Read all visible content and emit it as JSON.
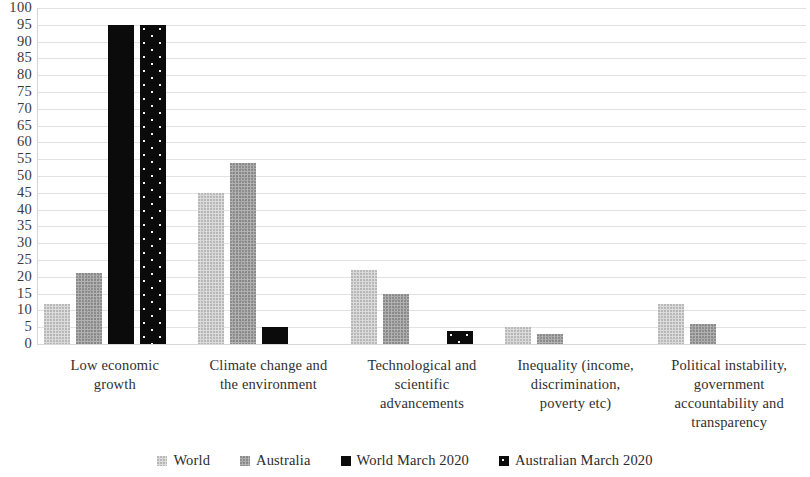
{
  "chart_data": {
    "type": "bar",
    "title": "",
    "subtitle": "",
    "xlabel": "",
    "ylabel": "",
    "ylim": [
      0,
      100
    ],
    "y_ticks": [
      0,
      5,
      10,
      15,
      20,
      25,
      30,
      35,
      40,
      45,
      50,
      55,
      60,
      65,
      70,
      75,
      80,
      85,
      90,
      95,
      100
    ],
    "grid": true,
    "legend_position": "bottom",
    "categories": [
      "Low economic growth",
      "Climate change and the environment",
      "Technological and scientific advancements",
      "Inequality (income, discrimination, poverty etc)",
      "Political instability, government accountability and transparency"
    ],
    "category_label_lines": [
      [
        "Low economic",
        "growth"
      ],
      [
        "Climate change and",
        "the environment"
      ],
      [
        "Technological and",
        "scientific",
        "advancements"
      ],
      [
        "Inequality (income,",
        "discrimination,",
        "poverty etc)"
      ],
      [
        "Political instability,",
        "government",
        "accountability and",
        "transparency"
      ]
    ],
    "series": [
      {
        "name": "World",
        "fill": "light-gray-speckle",
        "color": "#dcdcdc",
        "values": [
          12,
          45,
          22,
          5,
          12
        ]
      },
      {
        "name": "Australia",
        "fill": "medium-gray-speckle",
        "color": "#b2b2b2",
        "values": [
          21,
          54,
          15,
          3,
          6
        ]
      },
      {
        "name": "World March 2020",
        "fill": "solid-black",
        "color": "#0b0b0b",
        "values": [
          95,
          5,
          null,
          null,
          null
        ]
      },
      {
        "name": "Australian March 2020",
        "fill": "black-with-white-dots",
        "color": "#0b0b0b",
        "values": [
          95,
          null,
          4,
          null,
          null
        ]
      }
    ]
  },
  "legend": {
    "items": [
      {
        "label": "World",
        "swatch": "light-gray-speckle"
      },
      {
        "label": "Australia",
        "swatch": "medium-gray-speckle"
      },
      {
        "label": "World March 2020",
        "swatch": "solid-black"
      },
      {
        "label": "Australian March 2020",
        "swatch": "black-with-white-dots"
      }
    ]
  }
}
